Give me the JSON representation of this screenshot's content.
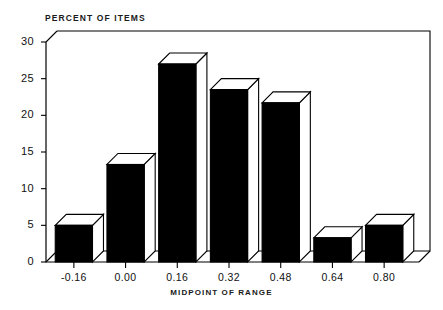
{
  "chart_data": {
    "type": "bar",
    "title": "",
    "ylabel": "PERCENT OF ITEMS",
    "xlabel": "MIDPOINT OF RANGE",
    "categories": [
      "-0.16",
      "0.00",
      "0.16",
      "0.32",
      "0.48",
      "0.64",
      "0.80"
    ],
    "values": [
      5.0,
      13.3,
      27.0,
      23.5,
      21.7,
      3.3,
      5.0
    ],
    "yticks": [
      "0",
      "5",
      "10",
      "15",
      "20",
      "25",
      "30"
    ],
    "ytick_values": [
      0,
      5,
      10,
      15,
      20,
      25,
      30
    ],
    "ylim": [
      0,
      30.8
    ],
    "grid": false,
    "legend": null,
    "style": {
      "bar_face_color": "#000000",
      "bar_top_color": "#ffffff",
      "bar_side_color": "#ffffff",
      "outline_color": "#000000",
      "background_color": "#ffffff",
      "axis_color": "#000000",
      "three_d": true
    }
  }
}
